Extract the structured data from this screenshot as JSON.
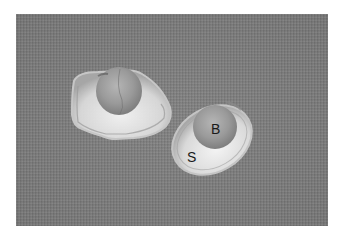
{
  "image": {
    "description": "Grayscale photograph of two translucent shell-like structures, each cradling a round bead, on a gray textured background",
    "background_color": "#7a7a7a",
    "labels": [
      {
        "id": "bead",
        "text": "B"
      },
      {
        "id": "shell",
        "text": "S"
      }
    ]
  }
}
